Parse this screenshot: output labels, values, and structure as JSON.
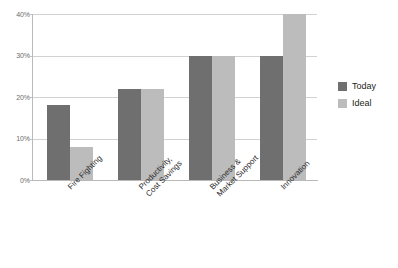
{
  "chart_data": {
    "type": "bar",
    "title": "",
    "subtitle": "",
    "xlabel": "",
    "ylabel": "",
    "ylim": [
      0,
      40
    ],
    "ytick_labels": [
      "0%",
      "10%",
      "20%",
      "30%",
      "40%"
    ],
    "ytick_values": [
      0,
      10,
      20,
      30,
      40
    ],
    "grid": true,
    "legend_position": "right",
    "categories": [
      "Fire Fighting",
      "Productivity,\nCost Savings",
      "Business &\nMarket Support",
      "Innovation"
    ],
    "series": [
      {
        "name": "Today",
        "color": "#6f6f6f",
        "values": [
          18,
          22,
          30,
          30
        ]
      },
      {
        "name": "Ideal",
        "color": "#bcbcbc",
        "values": [
          8,
          22,
          30,
          40
        ]
      }
    ]
  },
  "legend": {
    "items": [
      {
        "label": "Today",
        "color": "#6f6f6f"
      },
      {
        "label": "Ideal",
        "color": "#bcbcbc"
      }
    ]
  },
  "colors": {
    "today": "#6f6f6f",
    "ideal": "#bcbcbc",
    "gridline": "#d2d2d2",
    "axis": "#b9b9b9",
    "tick_text": "#6d6d6d",
    "category_text": "#2b2b2b",
    "background": "#ffffff"
  }
}
